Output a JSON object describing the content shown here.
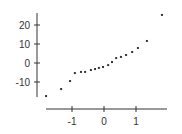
{
  "chart_data": {
    "type": "scatter",
    "title": "",
    "xlabel": "",
    "ylabel": "",
    "xlim": [
      -1.85,
      1.95
    ],
    "ylim": [
      -18,
      27
    ],
    "grid": false,
    "legend": null,
    "x_ticks": [
      -1,
      0,
      1
    ],
    "x_tick_labels": [
      "-1",
      "0",
      "1"
    ],
    "y_ticks": [
      -10,
      0,
      10,
      20
    ],
    "y_tick_labels": [
      "-10",
      "0",
      "10",
      "20"
    ],
    "series": [
      {
        "name": "sample quantiles",
        "x": [
          -1.81,
          -1.34,
          -1.06,
          -0.91,
          -0.72,
          -0.59,
          -0.41,
          -0.28,
          -0.16,
          -0.03,
          0.13,
          0.25,
          0.38,
          0.53,
          0.69,
          0.88,
          1.06,
          1.34,
          1.81
        ],
        "y": [
          -17.4,
          -13.7,
          -9.5,
          -5.3,
          -4.7,
          -4.7,
          -3.7,
          -3.2,
          -2.6,
          -2.1,
          -1.1,
          0.5,
          2.6,
          3.2,
          4.2,
          5.8,
          7.9,
          11.6,
          25.3
        ]
      }
    ]
  },
  "colors": {
    "axis": "#333333",
    "point": "#333333",
    "text": "#333333"
  }
}
